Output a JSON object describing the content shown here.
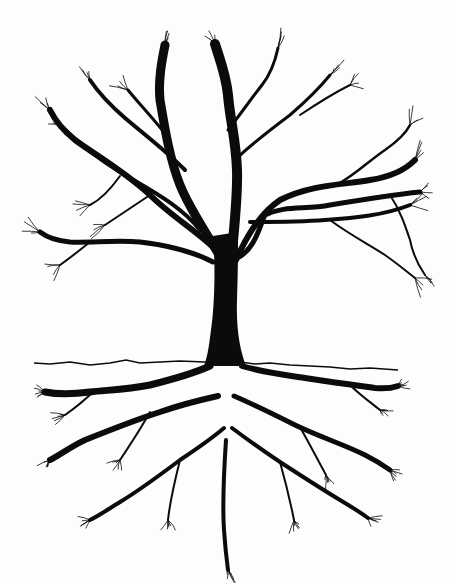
{
  "illustration": {
    "subject": "tree with mirrored root system",
    "style": "black ink line drawing on white",
    "colors": {
      "ink": "#0b0b0b",
      "paper": "#fdfdfd"
    },
    "ground_line": {
      "points": [
        [
          34,
          363
        ],
        [
          50,
          364
        ],
        [
          70,
          362
        ],
        [
          90,
          365
        ],
        [
          110,
          363
        ],
        [
          126,
          360
        ],
        [
          140,
          363
        ],
        [
          160,
          362
        ],
        [
          180,
          361
        ],
        [
          205,
          362
        ],
        [
          240,
          362
        ],
        [
          255,
          364
        ],
        [
          270,
          363
        ],
        [
          290,
          365
        ],
        [
          310,
          366
        ],
        [
          330,
          367
        ],
        [
          350,
          369
        ],
        [
          370,
          368
        ],
        [
          398,
          370
        ]
      ]
    },
    "trunk": {
      "path": "M213,236 C216,270 214,310 211,330 C209,345 208,355 204,366 L246,366 C240,350 236,330 237,300 C238,270 238,250 238,232 Z"
    },
    "branches": [
      {
        "d": "M222,260 C205,230 190,210 180,185 C170,160 165,130 160,100 C158,80 162,60 165,45",
        "w": 9
      },
      {
        "d": "M231,265 C233,235 238,200 237,170 C236,140 230,120 228,95 C226,75 220,60 215,44",
        "w": 10
      },
      {
        "d": "M236,260 C245,240 258,215 280,200 C310,185 340,185 370,180 C390,177 405,170 415,160",
        "w": 6
      },
      {
        "d": "M237,258 C255,250 260,225 265,215 C285,205 305,210 330,205 C360,200 390,195 420,192",
        "w": 5
      },
      {
        "d": "M250,222 C275,222 300,222 325,220 C355,218 385,215 410,205",
        "w": 4
      },
      {
        "d": "M214,248 C195,230 170,215 150,195 C125,172 100,158 75,140 C65,132 55,120 50,110",
        "w": 6
      },
      {
        "d": "M213,262 C190,250 165,245 140,242 C115,240 90,243 70,242 C58,241 48,238 40,232",
        "w": 5
      },
      {
        "d": "M200,230 C180,205 150,190 125,175 C100,160 80,145 60,125",
        "w": 4
      },
      {
        "d": "M185,170 C165,150 145,135 125,118 C110,105 100,95 90,80",
        "w": 4
      },
      {
        "d": "M170,140 C155,120 140,105 128,90",
        "w": 3
      },
      {
        "d": "M228,130 C240,115 250,100 262,85 C270,75 275,62 278,48",
        "w": 3
      },
      {
        "d": "M235,160 C250,145 270,130 290,115 C305,102 318,90 330,75",
        "w": 3
      },
      {
        "d": "M300,115 C315,105 330,95 350,85",
        "w": 2
      },
      {
        "d": "M338,184 C355,175 370,160 385,150 C395,143 405,135 410,125",
        "w": 2.5
      },
      {
        "d": "M390,195 C400,210 405,225 410,240 C413,255 418,265 425,275",
        "w": 2
      },
      {
        "d": "M330,220 C350,235 370,245 385,255 C395,262 405,270 415,278",
        "w": 2
      },
      {
        "d": "M90,242 C80,250 70,258 60,265",
        "w": 2
      },
      {
        "d": "M120,176 C110,190 100,200 90,205",
        "w": 2
      },
      {
        "d": "M150,195 C135,205 120,215 105,225",
        "w": 2
      }
    ],
    "roots": [
      {
        "d": "M210,366 C190,375 170,380 150,385 C125,390 105,390 90,392 C75,394 60,395 45,392",
        "w": 7
      },
      {
        "d": "M242,366 C262,372 285,375 305,378 C330,382 355,385 375,388 C385,389 392,388 398,386",
        "w": 6
      },
      {
        "d": "M218,396 C200,400 180,405 160,412 C135,420 110,430 85,440 C70,447 60,455 50,460",
        "w": 6
      },
      {
        "d": "M234,396 C255,405 275,415 295,425 C320,437 345,445 365,455 C375,460 383,465 390,470",
        "w": 5
      },
      {
        "d": "M224,428 C210,440 195,450 180,460 C160,475 140,490 120,502 C110,508 100,515 90,520",
        "w": 4
      },
      {
        "d": "M232,428 C248,440 265,452 280,462 C300,475 320,488 340,500 C350,506 360,512 368,518",
        "w": 4
      },
      {
        "d": "M226,440 C224,470 222,500 224,530 C225,545 226,555 228,570",
        "w": 4
      },
      {
        "d": "M150,412 C140,430 130,445 120,460",
        "w": 2
      },
      {
        "d": "M300,427 C310,445 318,460 326,475",
        "w": 2
      },
      {
        "d": "M180,460 C175,480 170,500 168,520",
        "w": 2
      },
      {
        "d": "M280,462 C285,480 290,500 294,520",
        "w": 2
      },
      {
        "d": "M95,390 C85,400 75,408 65,415",
        "w": 2
      },
      {
        "d": "M350,385 C360,395 370,402 380,410",
        "w": 2
      }
    ]
  }
}
